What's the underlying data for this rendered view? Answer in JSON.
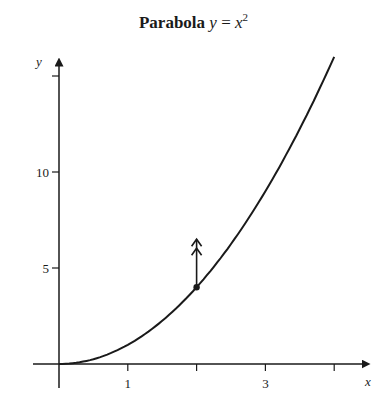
{
  "chart_data": {
    "type": "line",
    "title_parts": {
      "prefix": "Parabola",
      "lhs": "y",
      "eq": " = ",
      "base": "x",
      "exp": "2"
    },
    "xlabel": "x",
    "ylabel": "y",
    "xlim": [
      0,
      4.5
    ],
    "ylim": [
      0,
      16
    ],
    "x_ticks": [
      1,
      2,
      3,
      4
    ],
    "x_tick_labels": [
      "1",
      "",
      "3",
      ""
    ],
    "y_ticks": [
      5,
      10,
      15
    ],
    "y_tick_labels": [
      "5",
      "10",
      ""
    ],
    "grid": false,
    "series": [
      {
        "name": "y = x^2",
        "x": [
          0,
          0.5,
          1,
          1.5,
          2,
          2.5,
          3,
          3.5,
          4
        ],
        "y": [
          0,
          0.25,
          1,
          2.25,
          4,
          6.25,
          9,
          12.25,
          16
        ]
      }
    ],
    "annotations": [
      {
        "type": "point",
        "x": 2,
        "y": 4
      },
      {
        "type": "double-arrow-up",
        "from": [
          2,
          4
        ],
        "to": [
          2,
          6.5
        ]
      }
    ],
    "colors": {
      "line": "#1a1a1a",
      "background": "#ffffff"
    }
  }
}
